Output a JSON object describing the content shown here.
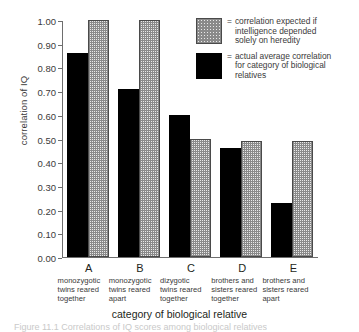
{
  "chart_data": {
    "type": "bar",
    "title": "",
    "xlabel": "category of biological relative",
    "ylabel": "correlation of IQ",
    "ylim": [
      0.0,
      1.0
    ],
    "ytick_labels": [
      "1.00",
      "0.90",
      "0.80",
      "0.70",
      "0.60",
      "0.50",
      "0.40",
      "0.30",
      "0.20",
      "0.10",
      "0.00"
    ],
    "ytick_values": [
      1.0,
      0.9,
      0.8,
      0.7,
      0.6,
      0.5,
      0.4,
      0.3,
      0.2,
      0.1,
      0.0
    ],
    "grid": false,
    "legend_position": "top-right",
    "categories": [
      "A",
      "B",
      "C",
      "D",
      "E"
    ],
    "category_descriptions": [
      "monozygotic twins reared together",
      "monozygotic twins reared apart",
      "dizygotic twins reared together",
      "brothers and sisters reared together",
      "brothers and sisters reared apart"
    ],
    "series": [
      {
        "name": "actual average correlation for category of biological relatives",
        "key": "actual",
        "color": "#000000",
        "pattern": "solid",
        "values": [
          0.86,
          0.71,
          0.6,
          0.46,
          0.23
        ]
      },
      {
        "name": "correlation expected if intelligence depended solely on heredity",
        "key": "expected",
        "color": "#e9e9e9",
        "pattern": "checkered",
        "values": [
          1.0,
          1.0,
          0.5,
          0.49,
          0.49
        ]
      }
    ]
  },
  "axis": {
    "y_title": "correlation of IQ",
    "x_title": "category of biological relative"
  },
  "categories": [
    {
      "letter": "A",
      "line1": "monozygotic",
      "line2": "twins reared",
      "line3": "together"
    },
    {
      "letter": "B",
      "line1": "monozygotic",
      "line2": "twins reared",
      "line3": "apart"
    },
    {
      "letter": "C",
      "line1": "dizygotic",
      "line2": "twins reared",
      "line3": "together"
    },
    {
      "letter": "D",
      "line1": "brothers and",
      "line2": "sisters reared",
      "line3": "together"
    },
    {
      "letter": "E",
      "line1": "brothers and",
      "line2": "sisters reared",
      "line3": "apart"
    }
  ],
  "legend": {
    "equals": "=",
    "entries": [
      {
        "swatch": "checkered-gray",
        "line1": "correlation expected if",
        "line2": "intelligence depended",
        "line3": "solely on heredity"
      },
      {
        "swatch": "solid-black",
        "line1": "actual average correlation",
        "line2": "for category of biological",
        "line3": "relatives"
      }
    ]
  },
  "caption": {
    "text": "Figure 11.1 Correlations of IQ scores among biological relatives"
  },
  "colors": {
    "actual_bar": "#000000",
    "expected_bar": "#e9e9e9",
    "axis": "#6e6e6e",
    "text": "#231f20"
  }
}
